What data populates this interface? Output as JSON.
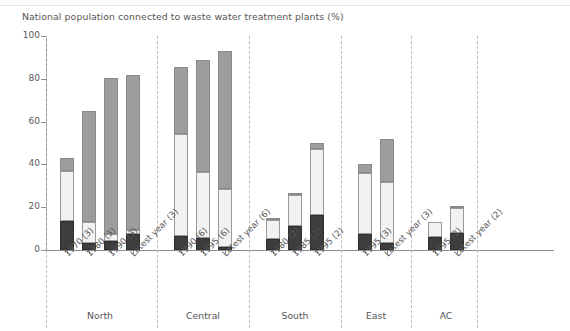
{
  "chart_data": {
    "type": "bar",
    "stacked": true,
    "title": "National population connected to waste water treatment plants (%)",
    "xlabel": "",
    "ylabel": "",
    "ylim": [
      0,
      100
    ],
    "yticks": [
      0,
      20,
      40,
      60,
      80,
      100
    ],
    "ytick_labels": [
      "0",
      "20",
      "40",
      "60",
      "80",
      "100"
    ],
    "grid": false,
    "legend": "none",
    "series": [
      {
        "name": "segment-1-dark",
        "color": "#3d3d3d",
        "values": [
          13.5,
          3.5,
          4.0,
          7.5,
          6.5,
          5.5,
          1.5,
          5.0,
          11.0,
          16.5,
          7.5,
          3.5,
          6.0,
          8.0
        ]
      },
      {
        "name": "segment-2-light",
        "color": "#f2f2f2",
        "values": [
          23.5,
          9.5,
          3.5,
          2.0,
          47.5,
          31.0,
          27.0,
          9.0,
          14.5,
          30.5,
          28.5,
          28.5,
          7.0,
          11.5
        ]
      },
      {
        "name": "segment-3-gray",
        "color": "#9d9d9d",
        "values": [
          6.0,
          52.0,
          73.0,
          72.5,
          31.5,
          52.5,
          64.5,
          1.0,
          0.5,
          3.0,
          4.0,
          20.0,
          0.0,
          0.5
        ]
      }
    ],
    "categories": [
      "1970 (3)",
      "1980 (3)",
      "1990 (3)",
      "Latest year (3)",
      "1990 (6)",
      "1995 (6)",
      "Latest year (6)",
      "1980 (2)",
      "1985 (2)",
      "1995 (2)",
      "1995 (3)",
      "Latest year (3)",
      "1995 (2)",
      "Latest year (2)"
    ],
    "totals": [
      43,
      65,
      80.5,
      82,
      85.5,
      89,
      93,
      15,
      26,
      50,
      40,
      52,
      13,
      20
    ],
    "groups": [
      {
        "label": "North",
        "count": 4
      },
      {
        "label": "Central",
        "count": 3
      },
      {
        "label": "South",
        "count": 3
      },
      {
        "label": "East",
        "count": 2
      },
      {
        "label": "AC",
        "count": 2
      }
    ]
  }
}
